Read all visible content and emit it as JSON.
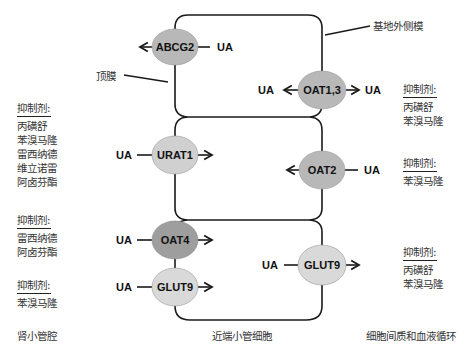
{
  "diagram": {
    "title": "",
    "colors": {
      "membrane": "#1a1a1a",
      "transporter_light": "#d9d9d9",
      "transporter_medium": "#b8b8b8",
      "transporter_dark": "#9e9e9e",
      "text": "#333333"
    },
    "substrate_label": "UA",
    "callouts": {
      "basolateral": "基地外侧模",
      "apical": "顶膜"
    },
    "regions": {
      "lumen": "肾小管腔",
      "cell": "近端小管细胞",
      "interstitium": "细胞间质和血液循环"
    },
    "transporters": [
      {
        "id": "abcg2",
        "label": "ABCG2",
        "membrane": "apical",
        "direction": "efflux-to-lumen",
        "shade": "medium"
      },
      {
        "id": "oat13",
        "label": "OAT1,3",
        "membrane": "basolateral",
        "direction": "uptake-from-blood (bidirectional arrows)",
        "shade": "medium"
      },
      {
        "id": "urat1",
        "label": "URAT1",
        "membrane": "apical",
        "direction": "reabsorption-into-cell",
        "shade": "light"
      },
      {
        "id": "oat2",
        "label": "OAT2",
        "membrane": "basolateral",
        "direction": "uptake-from-blood",
        "shade": "medium"
      },
      {
        "id": "oat4",
        "label": "OAT4",
        "membrane": "apical",
        "direction": "reabsorption-into-cell",
        "shade": "dark"
      },
      {
        "id": "glut9a",
        "label": "GLUT9",
        "membrane": "apical",
        "direction": "reabsorption-into-cell",
        "shade": "light"
      },
      {
        "id": "glut9b",
        "label": "GLUT9",
        "membrane": "basolateral",
        "direction": "efflux-to-blood",
        "shade": "light"
      }
    ],
    "inhibitor_groups": [
      {
        "id": "left-urat1",
        "heading": "抑制剂:",
        "drugs": [
          "丙磺舒",
          "苯溴马隆",
          "雷西纳德",
          "维立诺雷",
          "阿卤芬酯"
        ]
      },
      {
        "id": "left-oat4",
        "heading": "抑制剂:",
        "drugs": [
          "雷西纳德",
          "阿卤芬酯"
        ]
      },
      {
        "id": "left-glut9",
        "heading": "抑制剂:",
        "drugs": [
          "苯溴马隆"
        ]
      },
      {
        "id": "right-oat13",
        "heading": "抑制剂:",
        "drugs": [
          "丙磺舒",
          "苯溴马隆"
        ]
      },
      {
        "id": "right-oat2",
        "heading": "抑制剂:",
        "drugs": [
          "苯溴马隆"
        ]
      },
      {
        "id": "right-glut9",
        "heading": "抑制剂:",
        "drugs": [
          "丙磺舒",
          "苯溴马隆"
        ]
      }
    ]
  }
}
